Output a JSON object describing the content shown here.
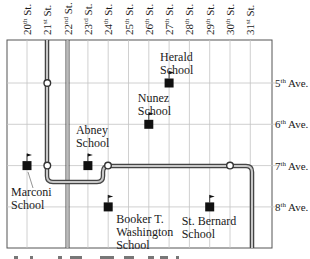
{
  "map": {
    "streets": [
      {
        "id": "20",
        "label": "20th St."
      },
      {
        "id": "21",
        "label": "21st St."
      },
      {
        "id": "22",
        "label": "22nd St."
      },
      {
        "id": "23",
        "label": "23rd St."
      },
      {
        "id": "24",
        "label": "24th St."
      },
      {
        "id": "25",
        "label": "25th St."
      },
      {
        "id": "26",
        "label": "26th St."
      },
      {
        "id": "27",
        "label": "27th St."
      },
      {
        "id": "28",
        "label": "28th St."
      },
      {
        "id": "29",
        "label": "29th St."
      },
      {
        "id": "30",
        "label": "30th St."
      },
      {
        "id": "31",
        "label": "31st St."
      }
    ],
    "avenues": [
      {
        "id": "5",
        "label": "5th Ave."
      },
      {
        "id": "6",
        "label": "6th Ave."
      },
      {
        "id": "7",
        "label": "7th Ave."
      },
      {
        "id": "8",
        "label": "8th Ave."
      }
    ],
    "schools": [
      {
        "name_line1": "Herald",
        "name_line2": "School",
        "street": 27,
        "avenue": 5
      },
      {
        "name_line1": "Nunez",
        "name_line2": "School",
        "street": 26,
        "avenue": 6
      },
      {
        "name_line1": "Abney",
        "name_line2": "School",
        "street": 23,
        "avenue": 7
      },
      {
        "name_line1": "Marconi",
        "name_line2": "School",
        "street": 20,
        "avenue": 7
      },
      {
        "name_line1": "Booker T.",
        "name_line2": "Washington",
        "name_line3": "School",
        "street": 24,
        "avenue": 8
      },
      {
        "name_line1": "St. Bernard",
        "name_line2": "School",
        "street": 29,
        "avenue": 8
      }
    ],
    "stations": [
      {
        "street": 21,
        "avenue": 5
      },
      {
        "street": 21,
        "avenue": 7
      },
      {
        "street": 24,
        "avenue": 7
      },
      {
        "street": 30,
        "avenue": 7
      }
    ]
  }
}
